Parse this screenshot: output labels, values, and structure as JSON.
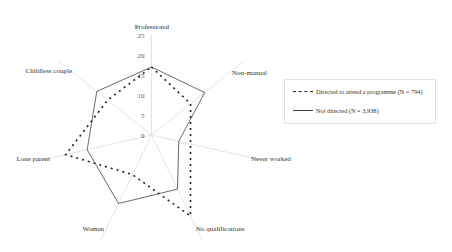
{
  "chart_data": {
    "type": "radar",
    "title": "",
    "axes": [
      "Professional",
      "Non-manual",
      "Never worked",
      "No qualifications",
      "Woman",
      "Lone parent",
      "Childless couple"
    ],
    "rlim": [
      0,
      25
    ],
    "ticks": [
      0,
      5,
      10,
      15,
      20,
      25
    ],
    "tick_labels": [
      "0",
      "5",
      "10",
      "15",
      "20",
      "25"
    ],
    "grid": "spokes only",
    "legend_position": "right",
    "series": [
      {
        "name": "Directed to attend a programme (N = 794)",
        "style": "dashed",
        "color": "#222222",
        "values": [
          17,
          12.5,
          10,
          22.5,
          11,
          22,
          14
        ]
      },
      {
        "name": "Not directed (N = 3,938)",
        "style": "solid",
        "color": "#444444",
        "values": [
          17,
          17,
          7,
          15,
          19,
          16.5,
          17.5
        ]
      }
    ]
  },
  "legend": {
    "items": [
      {
        "label": "Directed to attend a programme (N = 794)"
      },
      {
        "label": "Not directed (N = 3,938)"
      }
    ]
  }
}
